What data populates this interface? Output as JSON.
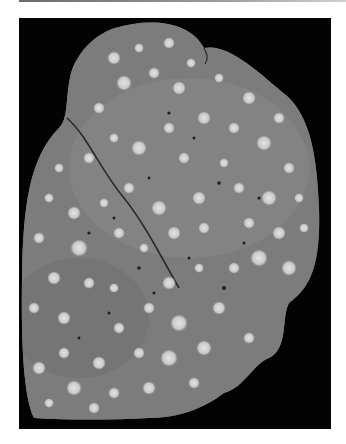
{
  "page": {
    "background": "#ffffff",
    "top_rule_color": "#7a7a7a"
  },
  "figure": {
    "kind": "grayscale gross pathology photograph",
    "background_color": "#030303",
    "tissue_color": "#7d7d7d",
    "nodule_color": "#d8d8d8",
    "caption": ""
  }
}
